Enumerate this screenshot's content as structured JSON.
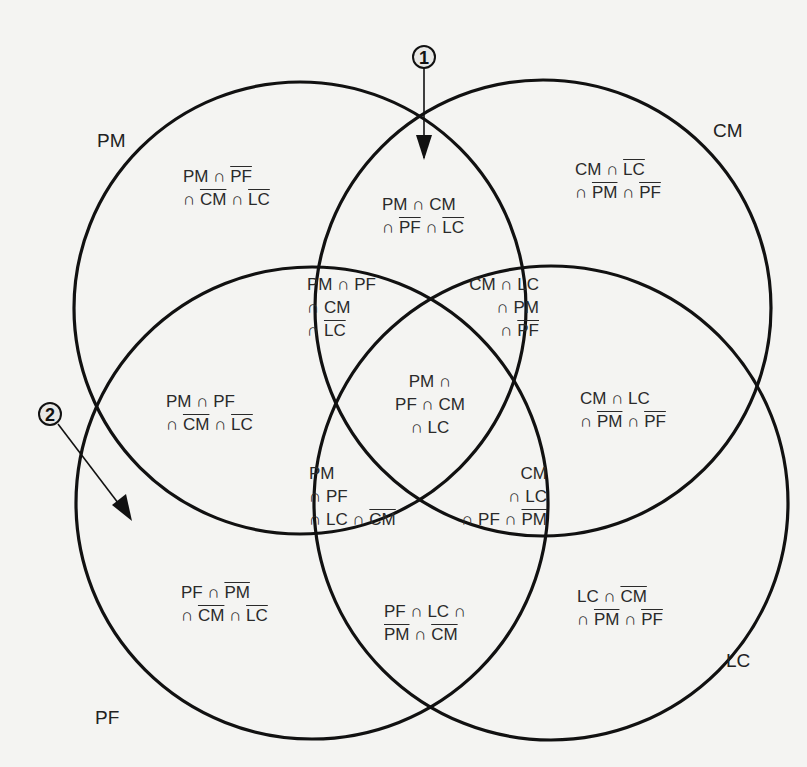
{
  "sets": [
    {
      "id": "PM",
      "label": "PM"
    },
    {
      "id": "CM",
      "label": "CM"
    },
    {
      "id": "PF",
      "label": "PF"
    },
    {
      "id": "LC",
      "label": "LC"
    }
  ],
  "markers": [
    {
      "id": "1",
      "label": "1",
      "description": "arrow pointing into PM ∩ CM region from top intersection"
    },
    {
      "id": "2",
      "label": "2",
      "description": "arrow pointing into PF-only region"
    }
  ],
  "regions": {
    "pm_only": [
      [
        {
          "t": "PM ∩ "
        },
        {
          "t": "PF",
          "ov": true
        }
      ],
      [
        {
          "t": "∩ "
        },
        {
          "t": "CM",
          "ov": true
        },
        {
          "t": " ∩ "
        },
        {
          "t": "LC",
          "ov": true
        }
      ]
    ],
    "cm_only": [
      [
        {
          "t": "CM ∩ "
        },
        {
          "t": "LC",
          "ov": true
        }
      ],
      [
        {
          "t": "∩ "
        },
        {
          "t": "PM",
          "ov": true
        },
        {
          "t": " ∩ "
        },
        {
          "t": "PF",
          "ov": true
        }
      ]
    ],
    "pm_cm": [
      [
        {
          "t": "PM ∩ CM"
        }
      ],
      [
        {
          "t": "∩ "
        },
        {
          "t": "PF",
          "ov": true
        },
        {
          "t": " ∩ "
        },
        {
          "t": "LC",
          "ov": true
        }
      ]
    ],
    "pm_pf_cm": [
      [
        {
          "t": "PM ∩ PF"
        }
      ],
      [
        {
          "t": "∩ CM"
        }
      ],
      [
        {
          "t": "∩ "
        },
        {
          "t": "LC",
          "ov": true
        }
      ]
    ],
    "cm_lc_pm": [
      [
        {
          "t": "CM ∩ LC"
        }
      ],
      [
        {
          "t": "∩ PM"
        }
      ],
      [
        {
          "t": "∩ "
        },
        {
          "t": "PF",
          "ov": true
        }
      ]
    ],
    "pm_pf": [
      [
        {
          "t": "PM ∩ PF"
        }
      ],
      [
        {
          "t": "∩ "
        },
        {
          "t": "CM",
          "ov": true
        },
        {
          "t": " ∩ "
        },
        {
          "t": "LC",
          "ov": true
        }
      ]
    ],
    "all_four": [
      [
        {
          "t": "PM ∩"
        }
      ],
      [
        {
          "t": "PF ∩ CM"
        }
      ],
      [
        {
          "t": "∩ LC"
        }
      ]
    ],
    "cm_lc": [
      [
        {
          "t": "CM ∩ LC"
        }
      ],
      [
        {
          "t": "∩ "
        },
        {
          "t": "PM",
          "ov": true
        },
        {
          "t": " ∩ "
        },
        {
          "t": "PF",
          "ov": true
        }
      ]
    ],
    "pm_pf_lc": [
      [
        {
          "t": "PM"
        }
      ],
      [
        {
          "t": "∩ PF"
        }
      ],
      [
        {
          "t": "∩ LC ∩ "
        },
        {
          "t": "CM",
          "ov": true
        }
      ]
    ],
    "cm_lc_pf": [
      [
        {
          "t": "CM"
        }
      ],
      [
        {
          "t": "∩ LC"
        }
      ],
      [
        {
          "t": "∩ PF ∩ "
        },
        {
          "t": "PM",
          "ov": true
        }
      ]
    ],
    "pf_only": [
      [
        {
          "t": "PF ∩ "
        },
        {
          "t": "PM",
          "ov": true
        }
      ],
      [
        {
          "t": "∩ "
        },
        {
          "t": "CM",
          "ov": true
        },
        {
          "t": " ∩ "
        },
        {
          "t": "LC",
          "ov": true
        }
      ]
    ],
    "pf_lc": [
      [
        {
          "t": "PF ∩ LC ∩"
        }
      ],
      [
        {
          "t": "PM",
          "ov": true
        },
        {
          "t": " ∩ "
        },
        {
          "t": "CM",
          "ov": true
        }
      ]
    ],
    "lc_only": [
      [
        {
          "t": "LC ∩ "
        },
        {
          "t": "CM",
          "ov": true
        }
      ],
      [
        {
          "t": "∩ "
        },
        {
          "t": "PM",
          "ov": true
        },
        {
          "t": " ∩ "
        },
        {
          "t": "PF",
          "ov": true
        }
      ]
    ]
  },
  "colors": {
    "line": "#111111",
    "background": "#f4f4f2",
    "text": "#2a2a2a"
  }
}
